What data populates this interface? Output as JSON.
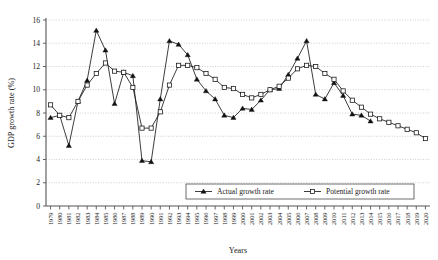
{
  "chart_data": {
    "type": "line",
    "title": "",
    "xlabel": "Years",
    "ylabel": "GDP growth rate (%)",
    "ylim": [
      0,
      16
    ],
    "ytick_step": 2,
    "yticks": [
      "0",
      "2",
      "4",
      "6",
      "8",
      "10",
      "12",
      "14",
      "16"
    ],
    "grid": true,
    "grid_axis": "y",
    "legend_position": "bottom-center",
    "categories": [
      "1979",
      "1980",
      "1981",
      "1982",
      "1983",
      "1984",
      "1985",
      "1986",
      "1987",
      "1988",
      "1989",
      "1990",
      "1991",
      "1992",
      "1993",
      "1994",
      "1995",
      "1996",
      "1997",
      "1998",
      "1999",
      "2000",
      "2001",
      "2002",
      "2003",
      "2004",
      "2005",
      "2006",
      "2007",
      "2008",
      "2009",
      "2010",
      "2011",
      "2012",
      "2013",
      "2014",
      "2015",
      "2016",
      "2017",
      "2018",
      "2019",
      "2020"
    ],
    "series": [
      {
        "name": "Actual growth rate",
        "marker": "filled-triangle",
        "values": [
          7.6,
          7.8,
          5.2,
          9.0,
          10.8,
          15.1,
          13.4,
          8.8,
          11.5,
          11.2,
          3.9,
          3.8,
          9.2,
          14.2,
          13.9,
          13.0,
          10.9,
          9.9,
          9.2,
          7.8,
          7.6,
          8.4,
          8.3,
          9.1,
          10.0,
          10.1,
          11.3,
          12.7,
          14.2,
          9.6,
          9.2,
          10.6,
          9.5,
          7.9,
          7.8,
          7.3,
          null,
          null,
          null,
          null,
          null,
          null
        ]
      },
      {
        "name": "Potential growth rate",
        "marker": "open-square",
        "values": [
          8.7,
          7.8,
          7.6,
          9.0,
          10.4,
          11.4,
          12.3,
          11.6,
          11.5,
          10.2,
          6.7,
          6.7,
          8.1,
          10.4,
          12.1,
          12.1,
          11.9,
          11.4,
          10.9,
          10.2,
          10.1,
          9.6,
          9.3,
          9.6,
          10.0,
          10.3,
          11.0,
          11.8,
          12.1,
          12.0,
          11.4,
          10.9,
          9.9,
          9.1,
          8.5,
          7.9,
          7.5,
          7.2,
          6.9,
          6.6,
          6.3,
          5.8
        ]
      }
    ]
  },
  "legend": {
    "items": [
      {
        "label": "Actual growth rate"
      },
      {
        "label": "Potential growth rate"
      }
    ]
  },
  "axes": {
    "y_title": "GDP growth rate (%)",
    "x_title": "Years"
  }
}
